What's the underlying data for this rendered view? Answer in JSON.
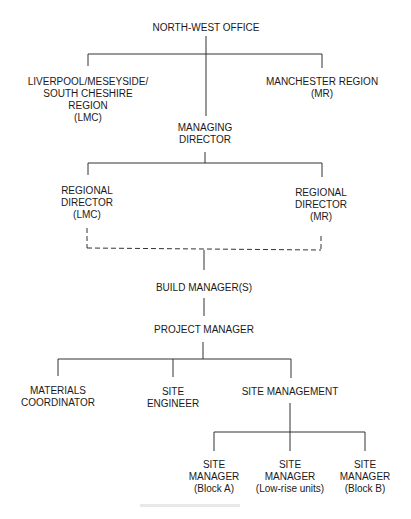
{
  "diagram": {
    "type": "organization-chart",
    "nodes": {
      "north_west_office": {
        "lines": [
          "NORTH-WEST OFFICE"
        ]
      },
      "lmc_region": {
        "lines": [
          "LIVERPOOL/MESEYSIDE/",
          "SOUTH CHESHIRE",
          "REGION",
          "(LMC)"
        ]
      },
      "manchester_region": {
        "lines": [
          "MANCHESTER REGION",
          "(MR)"
        ]
      },
      "managing_director": {
        "lines": [
          "MANAGING",
          "DIRECTOR"
        ]
      },
      "regional_director_lmc": {
        "lines": [
          "REGIONAL",
          "DIRECTOR",
          "(LMC)"
        ]
      },
      "regional_director_mr": {
        "lines": [
          "REGIONAL",
          "DIRECTOR",
          "(MR)"
        ]
      },
      "build_managers": {
        "lines": [
          "BUILD MANAGER(S)"
        ]
      },
      "project_manager": {
        "lines": [
          "PROJECT MANAGER"
        ]
      },
      "materials_coordinator": {
        "lines": [
          "MATERIALS",
          "COORDINATOR"
        ]
      },
      "site_engineer": {
        "lines": [
          "SITE",
          "ENGINEER"
        ]
      },
      "site_management": {
        "lines": [
          "SITE MANAGEMENT"
        ]
      },
      "site_manager_a": {
        "lines": [
          "SITE",
          "MANAGER",
          "(Block A)"
        ]
      },
      "site_manager_low": {
        "lines": [
          "SITE",
          "MANAGER",
          "(Low-rise units)"
        ]
      },
      "site_manager_b": {
        "lines": [
          "SITE",
          "MANAGER",
          "(Block B)"
        ]
      }
    },
    "edges": [
      [
        "north_west_office",
        "lmc_region"
      ],
      [
        "north_west_office",
        "manchester_region"
      ],
      [
        "north_west_office",
        "managing_director"
      ],
      [
        "managing_director",
        "regional_director_lmc"
      ],
      [
        "managing_director",
        "regional_director_mr"
      ],
      [
        "regional_director_lmc",
        "build_managers",
        "dashed"
      ],
      [
        "regional_director_mr",
        "build_managers",
        "dashed"
      ],
      [
        "build_managers",
        "project_manager"
      ],
      [
        "project_manager",
        "materials_coordinator"
      ],
      [
        "project_manager",
        "site_engineer"
      ],
      [
        "project_manager",
        "site_management"
      ],
      [
        "site_management",
        "site_manager_a"
      ],
      [
        "site_management",
        "site_manager_low"
      ],
      [
        "site_management",
        "site_manager_b"
      ]
    ]
  }
}
